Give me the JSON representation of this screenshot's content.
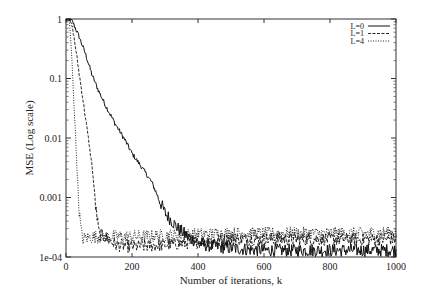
{
  "chart_data": {
    "type": "line",
    "title": "",
    "xlabel": "Number of iterations, k",
    "ylabel": "MSE (Log scale)",
    "xlim": [
      0,
      1000
    ],
    "ylim": [
      0.0001,
      1
    ],
    "yscale": "log",
    "grid": false,
    "legend_position": "top-right",
    "x_ticks": [
      0,
      200,
      400,
      600,
      800,
      1000
    ],
    "x_tick_labels": [
      "0",
      "200",
      "400",
      "600",
      "800",
      "1000"
    ],
    "y_ticks": [
      1,
      0.1,
      0.01,
      0.001,
      0.0001
    ],
    "y_tick_labels": [
      "1",
      "0.1",
      "0.01",
      "0.001",
      "1e-04"
    ],
    "series": [
      {
        "name": "L=0",
        "style": "solid",
        "x": [
          0,
          10,
          20,
          40,
          60,
          80,
          100,
          120,
          150,
          180,
          200,
          230,
          260,
          300,
          340,
          380,
          420,
          500,
          600,
          700,
          800,
          900,
          1000
        ],
        "values": [
          1,
          1,
          0.9,
          0.5,
          0.25,
          0.11,
          0.06,
          0.035,
          0.017,
          0.009,
          0.0055,
          0.0032,
          0.0018,
          0.00055,
          0.0003,
          0.0002,
          0.00016,
          0.00014,
          0.00013,
          0.00013,
          0.00013,
          0.00013,
          0.00013
        ]
      },
      {
        "name": "L=1",
        "style": "dashed",
        "x": [
          0,
          10,
          20,
          30,
          40,
          50,
          60,
          70,
          80,
          90,
          100,
          150,
          200,
          300,
          400,
          500,
          600,
          700,
          800,
          900,
          1000
        ],
        "values": [
          1,
          1,
          0.7,
          0.3,
          0.12,
          0.05,
          0.02,
          0.008,
          0.003,
          0.0007,
          0.00025,
          0.00016,
          0.00015,
          0.00016,
          0.00018,
          0.0002,
          0.0002,
          0.0002,
          0.0002,
          0.0002,
          0.0002
        ]
      },
      {
        "name": "L=4",
        "style": "dotted",
        "x": [
          0,
          10,
          15,
          20,
          25,
          30,
          35,
          40,
          45,
          50,
          60,
          100,
          200,
          300,
          400,
          500,
          600,
          700,
          800,
          900,
          1000
        ],
        "values": [
          1,
          0.9,
          0.4,
          0.12,
          0.03,
          0.008,
          0.002,
          0.0006,
          0.0003,
          0.0002,
          0.00021,
          0.00022,
          0.00022,
          0.00023,
          0.00024,
          0.00025,
          0.00025,
          0.00025,
          0.00025,
          0.00025,
          0.00026
        ]
      }
    ],
    "colors": {
      "line": "#111111",
      "axis": "#333333",
      "background": "#ffffff"
    }
  }
}
